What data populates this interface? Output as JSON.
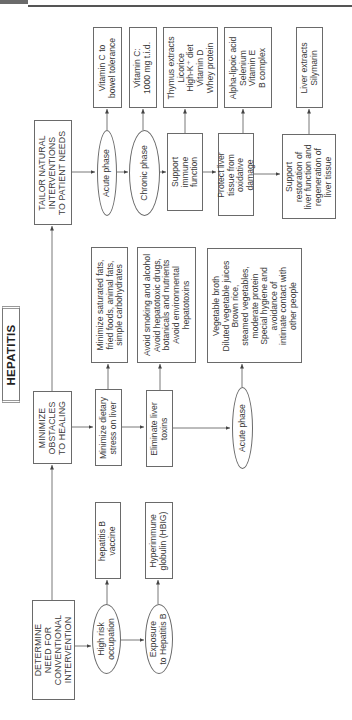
{
  "page_header": {
    "running_title": "Textbook of Natural Medicine",
    "note": "header text partially cropped at top edge"
  },
  "diagram": {
    "title": "HEPATITIS",
    "orientation": "rotated 90° counter-clockwise",
    "columns": [
      {
        "id": "determine",
        "heading": "DETERMINE\nNEED FOR\nCONVENTIONAL\nINTERVENTION",
        "branches": [
          {
            "condition": "High risk\noccupation",
            "action": "hepatitis B\nvaccine"
          },
          {
            "condition": "Exposure\nto Hepatitis B",
            "action": "Hyperimmune\nglobulin (HBIG)"
          }
        ]
      },
      {
        "id": "minimize",
        "heading": "MINIMIZE\nOBSTACLES\nTO HEALING",
        "branches": [
          {
            "step": "Minimize dietary\nstress on liver",
            "detail": "Minimize saturated fats,\nfried foods, animal fats,\nsimple carbohydrates"
          },
          {
            "step": "Eliminate liver\ntoxins",
            "detail": "Avoid smoking and alcohol\nAvoid hepatotoxic drugs,\nbotanicals and nutrients\nAvoid environmental\nhepatotoxins"
          },
          {
            "step": "Acute phase",
            "detail": "Vegetable broth\nDiluted vegetable juices\nBrown rice,\nsteamed vegetables,\nmoderate protein\nSpecial hygiene and\navoidance of\nintimate contact with\nother people"
          }
        ]
      },
      {
        "id": "tailor",
        "heading": "TAILOR NATURAL\nINTERVENTIONS\nTO PATIENT NEEDS",
        "branches": [
          {
            "step": "Acute phase",
            "detail": "Vitamin C to\nbowel tolerance"
          },
          {
            "step": "Chronic phase",
            "detail": "Vitamin C:\n1000 mg t.i.d."
          },
          {
            "step": "Support\nimmune\nfunction",
            "detail": "Thymus extracts\nLicorice\nHigh-K⁺ diet\nVitamin D\nWhey protein"
          },
          {
            "step": "Protect liver\ntissue from\noxidative\ndamage",
            "detail": "Alpha-lipoic acid\nSelenium\nVitamin E\nB complex"
          },
          {
            "step": "Support\nrestoration of\nliver function and\nregeneration of\nliver tissue",
            "detail": "Liver extracts\nSilymarin"
          }
        ]
      }
    ]
  },
  "colors": {
    "line": "#6a6a6a",
    "text": "#3a3a3a",
    "background": "#ffffff",
    "header_bar": "#555555"
  }
}
